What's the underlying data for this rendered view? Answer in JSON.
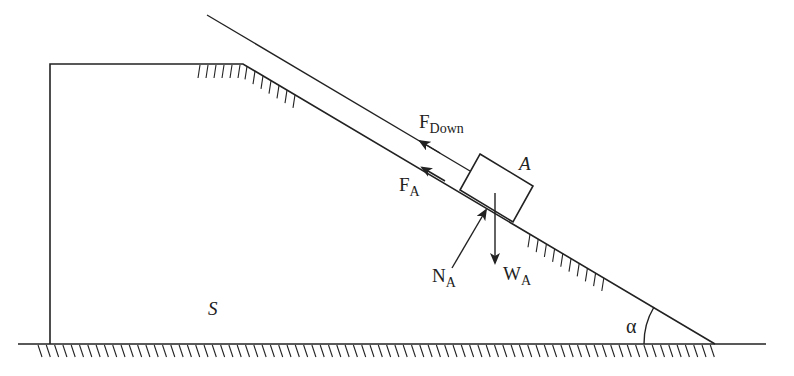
{
  "diagram": {
    "colors": {
      "stroke": "#222222",
      "background": "#ffffff"
    },
    "labels": {
      "body_support": "S",
      "block": "A",
      "angle": "α",
      "force_down": {
        "main": "F",
        "sub": "Down"
      },
      "force_friction": {
        "main": "F",
        "sub": "A"
      },
      "force_normal": {
        "main": "N",
        "sub": "A"
      },
      "force_weight": {
        "main": "W",
        "sub": "A"
      }
    },
    "geometry": {
      "ground_y": 344,
      "plateau_top_y": 64,
      "left_wall_x": 50,
      "slope_start": [
        243,
        64
      ],
      "slope_end": [
        715,
        344
      ],
      "upper_line_start": [
        207,
        15
      ]
    }
  }
}
